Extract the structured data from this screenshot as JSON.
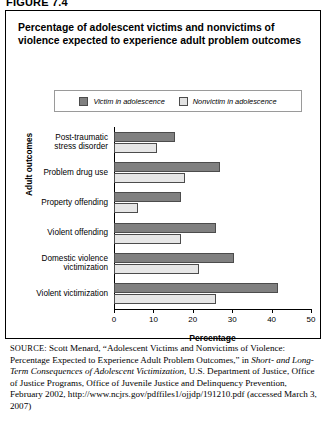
{
  "figure_label": "FIGURE 7.4",
  "title": "Percentage of adolescent victims and nonvictims of violence expected to experience adult problem outcomes",
  "legend": {
    "victim_label": "Victim in adolescence",
    "nonvictim_label": "Nonvictim in adolescence",
    "victim_color": "#808080",
    "nonvictim_color": "#e6e6e6"
  },
  "axis": {
    "y_title": "Adult outcomes",
    "x_title": "Percentage",
    "x_ticks": [
      "0",
      "10",
      "20",
      "30",
      "40",
      "50"
    ]
  },
  "source": {
    "prefix": "SOURCE:",
    "text_1": " Scott Menard, “Adolescent Victims and Nonvictims of Violence: Percentage Expected to Experience Adult Problem Outcomes,” in ",
    "italic_1": "Short- and Long-Term Consequences of Adolescent Victimization",
    "text_2": ", U.S. Department of Justice, Office of Justice Programs, Office of Juvenile Justice and Delinquency Prevention, February 2002, http://www.ncjrs.gov/pdffiles1/ojjdp/191210.pdf (accessed March 3, 2007)"
  },
  "chart_data": {
    "type": "bar",
    "orientation": "horizontal",
    "title": "Percentage of adolescent victims and nonvictims of violence expected to experience adult problem outcomes",
    "xlabel": "Percentage",
    "ylabel": "Adult outcomes",
    "xlim": [
      0,
      50
    ],
    "grid": false,
    "legend_position": "top-center",
    "categories": [
      "Post-traumatic stress disorder",
      "Problem drug use",
      "Property offending",
      "Violent offending",
      "Domestic violence victimization",
      "Violent victimization"
    ],
    "category_lines": [
      [
        "Post-traumatic",
        "stress disorder"
      ],
      [
        "Problem drug use"
      ],
      [
        "Property offending"
      ],
      [
        "Violent offending"
      ],
      [
        "Domestic violence",
        "victimization"
      ],
      [
        "Violent victimization"
      ]
    ],
    "series": [
      {
        "name": "Victim in adolescence",
        "color": "#808080",
        "values": [
          15.5,
          27.0,
          17.0,
          26.0,
          30.5,
          41.5
        ]
      },
      {
        "name": "Nonvictim in adolescence",
        "color": "#e6e6e6",
        "values": [
          10.8,
          18.0,
          6.0,
          17.0,
          21.5,
          26.0
        ]
      }
    ]
  }
}
